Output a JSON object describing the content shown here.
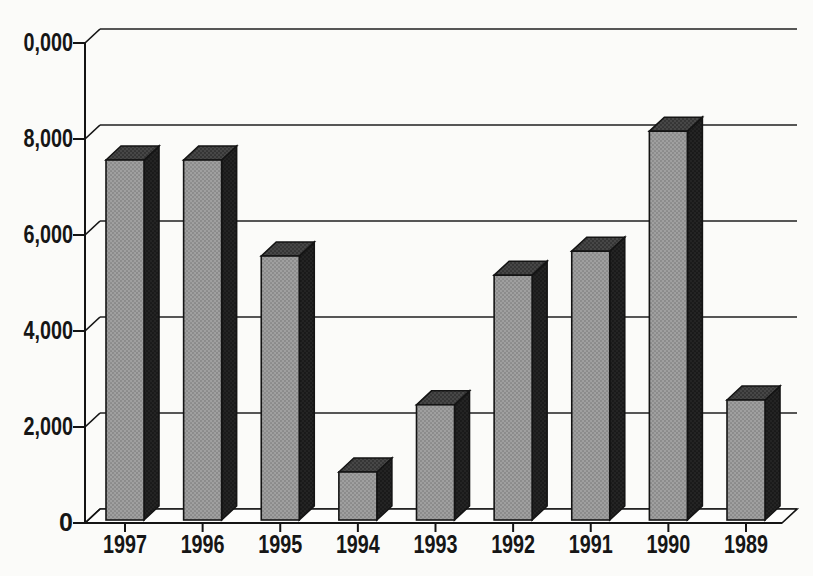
{
  "page": {
    "background": "#fbfbf9"
  },
  "chart_data": {
    "type": "bar",
    "variant": "3d-column",
    "title": "",
    "xlabel": "",
    "ylabel": "",
    "categories": [
      "1997",
      "1996",
      "1995",
      "1994",
      "1993",
      "1992",
      "1991",
      "1990",
      "1989"
    ],
    "values": [
      7500,
      7500,
      5500,
      1000,
      2400,
      5100,
      5600,
      8100,
      2500
    ],
    "ylim": [
      0,
      10000
    ],
    "ytick_interval": 2000,
    "ytick_labels_top_to_bottom": [
      "0,000",
      "8,000",
      "6,000",
      "4,000",
      "2,000",
      "0"
    ],
    "grid": true,
    "legend": false,
    "colors": {
      "background": "#fbfbf9",
      "bar_front": "#a0a0a0",
      "bar_top": "#474747",
      "bar_side": "#242424",
      "outline": "#141414",
      "grid_line": "#1f1f1f",
      "axis_line": "#141414",
      "axis_text": "#161616",
      "floor_fill": "#fdfdfc"
    }
  }
}
